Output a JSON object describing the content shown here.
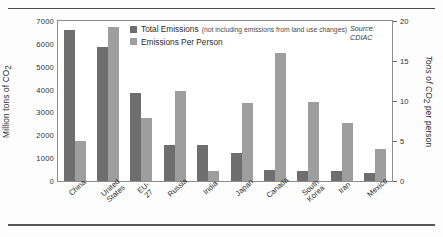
{
  "chart_data": {
    "type": "bar",
    "title": "",
    "categories": [
      "China",
      "United States",
      "EU-27",
      "Russia",
      "India",
      "Japan",
      "Canada",
      "South Korea",
      "Iran",
      "Mexico"
    ],
    "series": [
      {
        "name": "Total Emissions",
        "axis": "left",
        "unit": "Million tons of CO2",
        "values": [
          6600,
          5850,
          3870,
          1570,
          1560,
          1230,
          470,
          420,
          420,
          370
        ],
        "color": "#6e6e6e"
      },
      {
        "name": "Emissions Per Person",
        "axis": "right",
        "unit": "Tons of CO2 per person",
        "values": [
          5.0,
          19.3,
          7.9,
          11.2,
          1.3,
          9.7,
          16.0,
          9.9,
          7.2,
          4.0
        ],
        "color": "#9e9e9e"
      }
    ],
    "ylabel": "Million tons of CO2",
    "ylabel_right": "Tons of CO2 per person",
    "xlabel": "",
    "ylim": [
      0,
      7000
    ],
    "ylim_right": [
      0,
      20
    ],
    "yticks": [
      "0",
      "1000",
      "2000",
      "3000",
      "4000",
      "5000",
      "6000",
      "7000"
    ],
    "yticks_right": [
      "0",
      "5",
      "10",
      "15",
      "20"
    ],
    "grid": false,
    "legend_position": "top-center"
  },
  "legend": {
    "items": [
      {
        "label": "Total Emissions",
        "note": "(not including emissions from land use changes)",
        "color": "#6e6e6e"
      },
      {
        "label": "Emissions Per Person",
        "note": "",
        "color": "#9e9e9e"
      }
    ]
  },
  "source": "Source:\nCDIAC",
  "axis_titles": {
    "left_prefix": "Million tons of CO",
    "left_sub": "2",
    "right_prefix": "Tons of CO",
    "right_sub": "2",
    "right_suffix": " per person"
  }
}
